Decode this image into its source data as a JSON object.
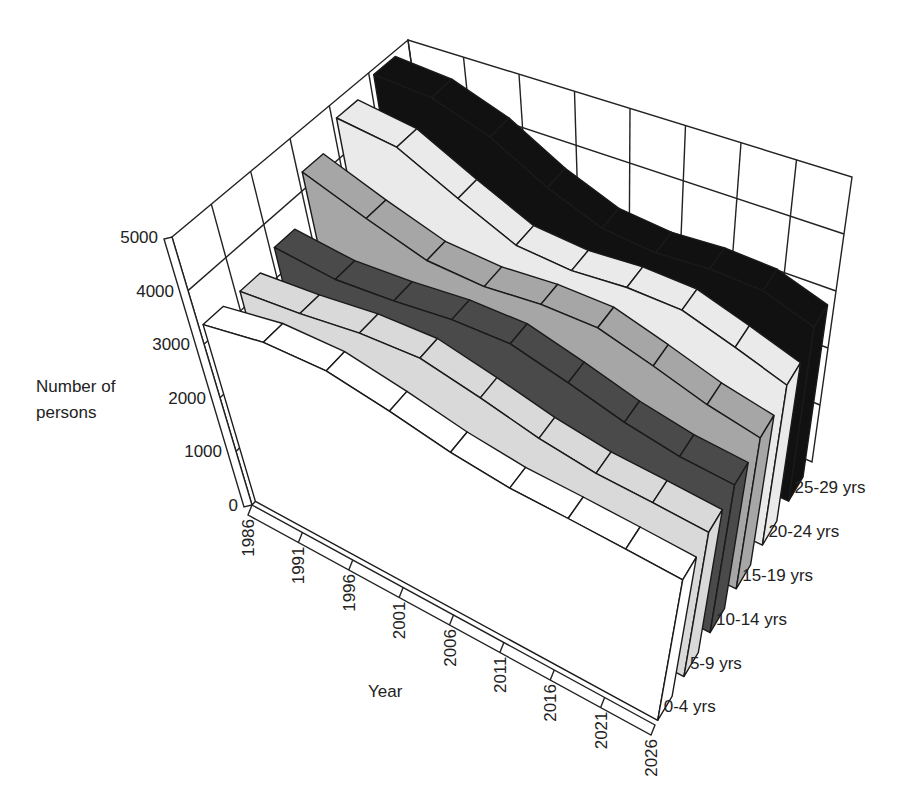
{
  "chart_data": {
    "type": "area",
    "subtype": "3d-ribbon",
    "title": "",
    "xlabel": "Year",
    "ylabel": "Number of persons",
    "ylim": [
      0,
      5000
    ],
    "yticks": [
      0,
      1000,
      2000,
      3000,
      4000,
      5000
    ],
    "ytick_labels": [
      "0",
      "1000",
      "2000",
      "3000",
      "4000",
      "5000"
    ],
    "categories": [
      "1986",
      "1991",
      "1996",
      "2001",
      "2006",
      "2011",
      "2016",
      "2021",
      "2026"
    ],
    "grid": true,
    "legend_position": "series labels at right end of each ribbon",
    "series": [
      {
        "name": "0-4 yrs",
        "color": "#ffffff",
        "values": [
          3300,
          3400,
          3300,
          3000,
          2700,
          2500,
          2400,
          2300,
          2200
        ]
      },
      {
        "name": "5-9 yrs",
        "color": "#d9d9d9",
        "values": [
          3300,
          3300,
          3350,
          3300,
          3000,
          2700,
          2500,
          2400,
          2300
        ]
      },
      {
        "name": "10-14 yrs",
        "color": "#4a4a4a",
        "values": [
          3500,
          3300,
          3300,
          3350,
          3300,
          3000,
          2700,
          2500,
          2400
        ]
      },
      {
        "name": "15-19 yrs",
        "color": "#a6a6a6",
        "values": [
          4300,
          3800,
          3400,
          3300,
          3350,
          3300,
          3000,
          2700,
          2500
        ]
      },
      {
        "name": "20-24 yrs",
        "color": "#eaeaea",
        "values": [
          4700,
          4500,
          3900,
          3400,
          3300,
          3350,
          3300,
          3000,
          2700
        ]
      },
      {
        "name": "25-29 yrs",
        "color": "#111111",
        "values": [
          4900,
          4800,
          4400,
          3800,
          3400,
          3300,
          3350,
          3300,
          3000
        ]
      }
    ]
  }
}
